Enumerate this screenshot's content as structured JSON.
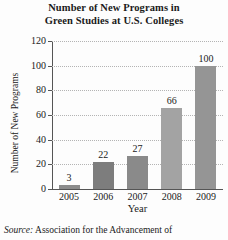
{
  "chart_data": {
    "type": "bar",
    "title": "Number of New Programs in Green Studies at U.S. Colleges",
    "title_lines": [
      "Number of New Programs in",
      "Green Studies at U.S. Colleges"
    ],
    "categories": [
      "2005",
      "2006",
      "2007",
      "2008",
      "2009"
    ],
    "values": [
      3,
      22,
      27,
      66,
      100
    ],
    "xlabel": "Year",
    "ylabel": "Number of New Programs",
    "ylim": [
      0,
      120
    ],
    "ytick_labels": [
      "0",
      "20",
      "40",
      "60",
      "80",
      "100",
      "120"
    ],
    "ytick_values": [
      0,
      20,
      40,
      60,
      80,
      100,
      120
    ],
    "grid": "horizontal-dotted",
    "legend": "none",
    "bar_colors": [
      "#8c8c8c",
      "#7d7d7d",
      "#8a8a8a",
      "#a3a3a3",
      "#959595"
    ],
    "data_labels": [
      "3",
      "22",
      "27",
      "66",
      "100"
    ]
  },
  "source": {
    "label": "Source:",
    "text": "Association for the Advancement of"
  }
}
